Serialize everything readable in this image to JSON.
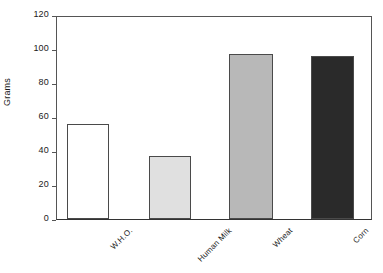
{
  "chart_data": {
    "type": "bar",
    "title": "",
    "subtitle": "",
    "xlabel": "",
    "ylabel": "Grams",
    "categories": [
      "W.H.O.",
      "Human Milk",
      "Wheat",
      "Corn"
    ],
    "values": [
      56,
      37,
      97,
      96
    ],
    "series": [
      {
        "name": "Grams",
        "values": [
          56,
          37,
          97,
          96
        ]
      }
    ],
    "ylim": [
      0,
      120
    ],
    "yticks": [
      0,
      20,
      40,
      60,
      80,
      100,
      120
    ],
    "ytick_labels": [
      "0",
      "20",
      "40",
      "60",
      "80",
      "100",
      "120"
    ],
    "grid": false,
    "legend": false,
    "legend_position": "none",
    "xtick_rotation": -45,
    "bar_colors": [
      "#ffffff",
      "#e0e0e0",
      "#b8b8b8",
      "#2a2a2a"
    ],
    "bar_edge_color": "#4a4a4a",
    "axis_color": "#555555",
    "text_color": "#1a1a1a",
    "background_color": "#ffffff"
  }
}
